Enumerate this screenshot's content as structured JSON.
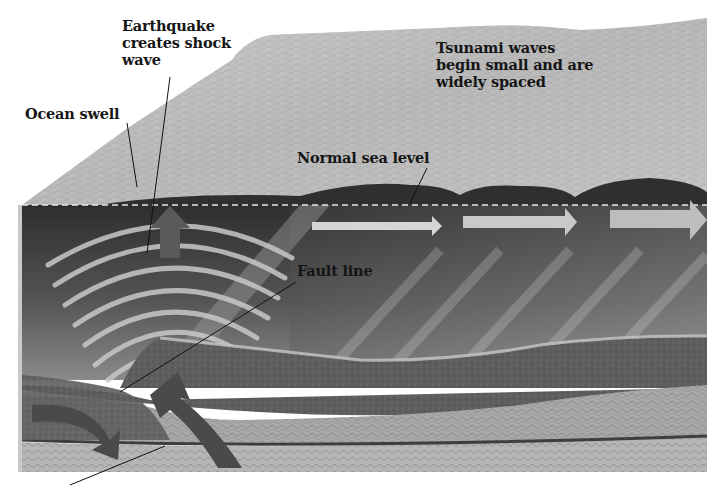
{
  "diagram": {
    "labels": {
      "earthquake": "Earthquake\ncreates shock\nwave",
      "ocean_swell": "Ocean swell",
      "tsunami_waves": "Tsunami waves\nbegin small and are\nwidely spaced",
      "sea_level": "Normal sea level",
      "fault_line": "Fault line"
    },
    "elements": {
      "uplift_arrow": "upward-arrow",
      "wave_arrows": [
        "right-arrow",
        "right-arrow",
        "right-arrow"
      ],
      "plate_arrows": [
        "subduction-arrow",
        "uplift-arrow"
      ],
      "sea_level_line": "dashed-line"
    },
    "colors": {
      "sky": "#ffffff",
      "ocean_surface": "#b8b8b8",
      "ocean_deep": "#3a3a3a",
      "arrow": "#cfcfcf",
      "plate_dark": "#5a5a5a",
      "plate_light": "#a5a5a5",
      "text": "#151515"
    }
  }
}
